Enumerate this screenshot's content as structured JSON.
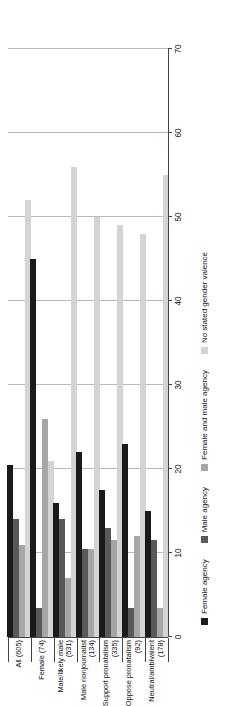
{
  "chart_data": {
    "type": "bar",
    "orientation": "horizontal",
    "title": "",
    "subtitle": "",
    "xlabel": "",
    "ylabel": "",
    "xlim": [
      0,
      70
    ],
    "grid": true,
    "legend_position": "bottom",
    "xticks": [
      "0",
      "10",
      "20",
      "30",
      "40",
      "50",
      "60",
      "70"
    ],
    "xtick_values": [
      0,
      10,
      20,
      30,
      40,
      50,
      60,
      70
    ],
    "categories": [
      "All (605)",
      "Female (74)",
      "Male/likely male (531)",
      "Male nonjournalist (134)",
      "Support pronatalism (335)",
      "Oppose pronatalism (92)",
      "Neutral/ambivalent (178)"
    ],
    "category_lines": [
      [
        "All (605)"
      ],
      [
        "Female (74)"
      ],
      [
        "Male/likely male",
        "(531)"
      ],
      [
        "Male nonjournalist",
        "(134)"
      ],
      [
        "Support pronatalism",
        "(335)"
      ],
      [
        "Oppose pronatalism",
        "(92)"
      ],
      [
        "Neutral/ambivalent",
        "(178)"
      ]
    ],
    "series": [
      {
        "name": "Female agency",
        "color": "#1a1a1a",
        "values": [
          20.5,
          45.0,
          16.0,
          22.0,
          17.5,
          23.0,
          15.0
        ]
      },
      {
        "name": "Male agency",
        "color": "#595959",
        "values": [
          14.0,
          3.5,
          14.0,
          10.5,
          13.0,
          3.5,
          11.5
        ]
      },
      {
        "name": "Female and male agency",
        "color": "#a6a6a6",
        "values": [
          11.0,
          26.0,
          7.0,
          10.5,
          11.5,
          12.0,
          3.5
        ]
      },
      {
        "name": "No stated gender valence",
        "color": "#d4d4d4",
        "values": [
          52.0,
          21.0,
          56.0,
          50.0,
          49.0,
          48.0,
          55.0
        ]
      }
    ]
  },
  "legend": {
    "items": [
      {
        "label": "Female agency",
        "color": "#1a1a1a"
      },
      {
        "label": "Male agency",
        "color": "#595959"
      },
      {
        "label": "Female and male agency",
        "color": "#a6a6a6"
      },
      {
        "label": "No stated gender valence",
        "color": "#d4d4d4"
      }
    ]
  }
}
